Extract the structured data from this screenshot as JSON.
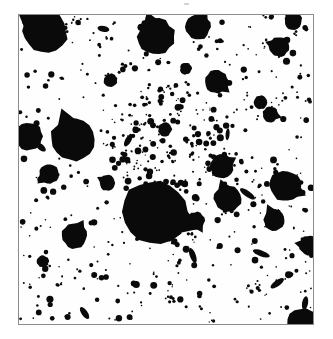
{
  "figure": {
    "name": "star-field-plate",
    "kind": "scanned-photographic-plate",
    "title": "",
    "caption": "",
    "frame": {
      "x": 18,
      "y": 14,
      "width": 296,
      "height": 311,
      "border_color": "#8c8c8c",
      "border_width_px": 1,
      "background_color": "#fefefe"
    },
    "page_background": "#ffffff",
    "object_color": "#0a0a0a",
    "scan_speck": {
      "x": 184,
      "y": 3,
      "width": 5,
      "height": 2,
      "color": "#cfcfcf"
    }
  },
  "chart_data": {
    "type": "scatter",
    "title": "",
    "xlabel": "",
    "ylabel": "",
    "xlim": [
      0,
      296
    ],
    "ylim": [
      0,
      311
    ],
    "grid": false,
    "legend": null,
    "marker_color": "#0a0a0a",
    "series": [
      {
        "name": "bright-saturated-stars",
        "marker": "disc-with-spike",
        "points": [
          {
            "x": 26,
            "y": 16,
            "r": 23,
            "spike": 215,
            "spike_len": 10
          },
          {
            "x": 138,
            "y": 22,
            "r": 19,
            "spike": 250,
            "spike_len": 8
          },
          {
            "x": 180,
            "y": 12,
            "r": 13,
            "spike": 300,
            "spike_len": 6
          },
          {
            "x": 137,
            "y": 198,
            "r": 33,
            "spike": 20,
            "spike_len": 16
          },
          {
            "x": 54,
            "y": 125,
            "r": 22,
            "spike": 250,
            "spike_len": 11
          },
          {
            "x": 10,
            "y": 122,
            "r": 14,
            "spike": 190,
            "spike_len": 6
          },
          {
            "x": 199,
            "y": 67,
            "r": 12,
            "spike": 40,
            "spike_len": 5
          },
          {
            "x": 262,
            "y": 32,
            "r": 10,
            "spike": 200,
            "spike_len": 5
          },
          {
            "x": 204,
            "y": 152,
            "r": 12,
            "spike": 330,
            "spike_len": 5
          },
          {
            "x": 210,
            "y": 185,
            "r": 14,
            "spike": 250,
            "spike_len": 7
          },
          {
            "x": 268,
            "y": 172,
            "r": 16,
            "spike": 25,
            "spike_len": 7
          },
          {
            "x": 257,
            "y": 206,
            "r": 11,
            "spike": 245,
            "spike_len": 6
          },
          {
            "x": 178,
            "y": 207,
            "r": 9,
            "spike": 60,
            "spike_len": 5
          },
          {
            "x": 56,
            "y": 222,
            "r": 13,
            "spike": 300,
            "spike_len": 5
          },
          {
            "x": 30,
            "y": 160,
            "r": 10,
            "spike": 140,
            "spike_len": 5
          },
          {
            "x": 253,
            "y": 100,
            "r": 8,
            "spike": 15,
            "spike_len": 4
          },
          {
            "x": 243,
            "y": 88,
            "r": 7,
            "spike": 0,
            "spike_len": 0
          },
          {
            "x": 89,
            "y": 169,
            "r": 8,
            "spike": 210,
            "spike_len": 4
          },
          {
            "x": 286,
            "y": 312,
            "r": 17,
            "spike": 120,
            "spike_len": 6
          },
          {
            "x": 292,
            "y": 232,
            "r": 10,
            "spike": 190,
            "spike_len": 5
          },
          {
            "x": 276,
            "y": 6,
            "r": 9,
            "spike": 230,
            "spike_len": 4
          },
          {
            "x": 92,
            "y": 66,
            "r": 7,
            "spike": 0,
            "spike_len": 0
          },
          {
            "x": 147,
            "y": 115,
            "r": 7,
            "spike": 0,
            "spike_len": 0
          },
          {
            "x": 24,
            "y": 248,
            "r": 6,
            "spike": 0,
            "spike_len": 0
          },
          {
            "x": 168,
            "y": 54,
            "r": 6,
            "spike": 0,
            "spike_len": 0
          }
        ]
      },
      {
        "name": "elongated-streaks",
        "marker": "ellipse",
        "points": [
          {
            "x": 230,
            "y": 180,
            "rx": 9,
            "ry": 3,
            "angle": 35
          },
          {
            "x": 175,
            "y": 242,
            "rx": 8,
            "ry": 3,
            "angle": 70
          },
          {
            "x": 244,
            "y": 240,
            "rx": 9,
            "ry": 3,
            "angle": 20
          },
          {
            "x": 110,
            "y": 126,
            "rx": 7,
            "ry": 3,
            "angle": 120
          },
          {
            "x": 66,
            "y": 300,
            "rx": 7,
            "ry": 3,
            "angle": 55
          },
          {
            "x": 260,
            "y": 270,
            "rx": 8,
            "ry": 3,
            "angle": 145
          },
          {
            "x": 85,
            "y": 14,
            "rx": 6,
            "ry": 3,
            "angle": 10
          },
          {
            "x": 288,
            "y": 290,
            "rx": 7,
            "ry": 3,
            "angle": 100
          },
          {
            "x": 22,
            "y": 133,
            "rx": 6,
            "ry": 3,
            "angle": 40
          },
          {
            "x": 210,
            "y": 120,
            "rx": 6,
            "ry": 2,
            "angle": 95
          }
        ]
      },
      {
        "name": "faint-field-stars",
        "marker": "disc",
        "count_estimate": 620,
        "radius_range": [
          0.8,
          3.6
        ],
        "distribution": "random-with-central-clustering",
        "cluster_center": [
          150,
          130
        ],
        "cluster_radius": 60,
        "cluster_fraction": 0.22,
        "seed": 20240517
      }
    ]
  }
}
